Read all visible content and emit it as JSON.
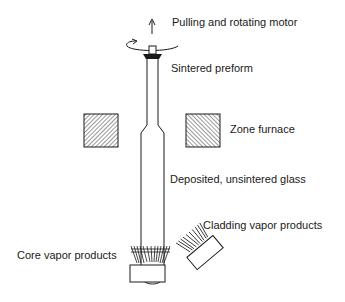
{
  "colors": {
    "ink": "#1a1a1a",
    "background": "#ffffff"
  },
  "labels": {
    "motor": "Pulling and rotating motor",
    "sintered": "Sintered preform",
    "furnace": "Zone furnace",
    "deposited": "Deposited, unsintered glass",
    "cladding": "Cladding vapor products",
    "core": "Core vapor products"
  },
  "icons": {
    "pull_arrow": "up-arrow-icon",
    "rotation": "rotation-arrow-icon",
    "furnace": "hatched-furnace-block",
    "torch": "burner-torch"
  }
}
